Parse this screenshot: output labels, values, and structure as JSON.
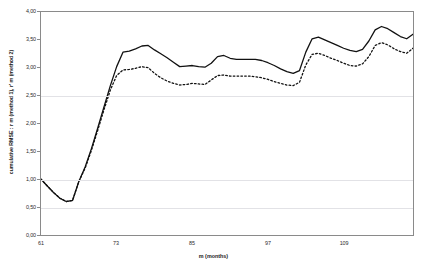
{
  "chart": {
    "title": "",
    "y_axis_title": "cumulative RMSE :  r m (method 1),  r' m (method 2)",
    "x_axis_title": "m (months)",
    "y_ticks": [
      "4,00",
      "3,50",
      "3,00",
      "2,50",
      "2,00",
      "1,50",
      "1,00",
      "0,50",
      "0,00"
    ],
    "x_ticks": [
      "61",
      "73",
      "85",
      "97",
      "109"
    ]
  },
  "chart_data": {
    "type": "line",
    "title": "",
    "xlabel": "m (months)",
    "ylabel": "cumulative RMSE :  r m (method 1),  r' m (method 2)",
    "xlim": [
      61,
      120
    ],
    "ylim": [
      0.0,
      4.0
    ],
    "yticks": [
      0.0,
      0.5,
      1.0,
      1.5,
      2.0,
      2.5,
      3.0,
      3.5,
      4.0
    ],
    "xticks": [
      61,
      73,
      85,
      97,
      109
    ],
    "grid": true,
    "legend": "none",
    "x": [
      61,
      62,
      63,
      64,
      65,
      66,
      67,
      68,
      69,
      70,
      71,
      72,
      73,
      74,
      75,
      76,
      77,
      78,
      79,
      80,
      81,
      82,
      83,
      84,
      85,
      86,
      87,
      88,
      89,
      90,
      91,
      92,
      93,
      94,
      95,
      96,
      97,
      98,
      99,
      100,
      101,
      102,
      103,
      104,
      105,
      106,
      107,
      108,
      109,
      110,
      111,
      112,
      113,
      114,
      115,
      116,
      117,
      118,
      119,
      120
    ],
    "series": [
      {
        "name": "r m (method 1)",
        "style": "solid",
        "color": "#111111",
        "values": [
          1.0,
          0.88,
          0.76,
          0.66,
          0.6,
          0.62,
          0.96,
          1.22,
          1.55,
          1.92,
          2.3,
          2.68,
          3.02,
          3.28,
          3.3,
          3.34,
          3.39,
          3.4,
          3.32,
          3.25,
          3.18,
          3.1,
          3.02,
          3.03,
          3.04,
          3.02,
          3.01,
          3.08,
          3.2,
          3.22,
          3.17,
          3.15,
          3.15,
          3.15,
          3.15,
          3.13,
          3.09,
          3.04,
          2.98,
          2.93,
          2.9,
          2.95,
          3.28,
          3.52,
          3.55,
          3.5,
          3.45,
          3.4,
          3.35,
          3.31,
          3.29,
          3.33,
          3.48,
          3.68,
          3.74,
          3.7,
          3.63,
          3.56,
          3.52,
          3.6
        ]
      },
      {
        "name": "r' m (method 2)",
        "style": "dotted",
        "color": "#111111",
        "values": [
          1.0,
          0.88,
          0.76,
          0.66,
          0.6,
          0.62,
          0.96,
          1.2,
          1.52,
          1.88,
          2.25,
          2.6,
          2.86,
          2.96,
          2.97,
          2.99,
          3.02,
          3.0,
          2.9,
          2.82,
          2.76,
          2.72,
          2.69,
          2.7,
          2.72,
          2.71,
          2.7,
          2.78,
          2.86,
          2.87,
          2.85,
          2.85,
          2.85,
          2.85,
          2.84,
          2.82,
          2.79,
          2.75,
          2.72,
          2.69,
          2.68,
          2.74,
          3.05,
          3.24,
          3.26,
          3.22,
          3.17,
          3.13,
          3.08,
          3.04,
          3.03,
          3.07,
          3.2,
          3.4,
          3.45,
          3.41,
          3.34,
          3.29,
          3.26,
          3.35
        ]
      }
    ]
  }
}
